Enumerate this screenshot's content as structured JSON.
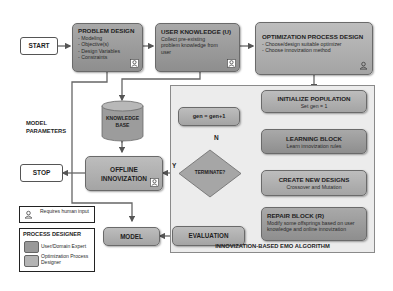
{
  "start": {
    "label": "START"
  },
  "stop": {
    "label": "STOP"
  },
  "problem_design": {
    "title": "PROBLEM DESIGN",
    "items": [
      "Modeling",
      "Objective(s)",
      "Design Variables",
      "Constraints"
    ]
  },
  "user_knowledge": {
    "title": "USER KNOWLEDGE (U)",
    "desc": "Collect pre-existing problem knowledge from user"
  },
  "optimization_process_design": {
    "title": "OPTIMIZATION PROCESS DESIGN",
    "items": [
      "Choose/design suitable optimizer",
      "Choose innovization method"
    ]
  },
  "model_parameters": {
    "line1": "MODEL",
    "line2": "PARAMETERS"
  },
  "knowledge_base": {
    "line1": "KNOWLEDGE",
    "line2": "BASE"
  },
  "offline_innovization": {
    "line1": "OFFLINE",
    "line2": "INNOVIZATION"
  },
  "model": {
    "label": "MODEL"
  },
  "evaluation": {
    "label": "EVALUATION"
  },
  "terminate": {
    "label": "TERMINATE?",
    "yes": "Y",
    "no": "N"
  },
  "gen_update": {
    "label": "gen = gen+1"
  },
  "emo_panel": {
    "title": "INNOVIZATION-BASED EMO ALGORITHM",
    "initialize": {
      "title": "INITIALIZE POPULATION",
      "desc": "Set gen = 1"
    },
    "learning": {
      "title": "LEARNING BLOCK",
      "desc": "Learn innovization rules"
    },
    "create": {
      "title": "CREATE NEW DESIGNS",
      "desc": "Crossover and Mutation"
    },
    "repair": {
      "title": "REPAIR BLOCK (R)",
      "desc": "Modify some offsprings based on user knowledge and online innovization"
    }
  },
  "legend": {
    "human_input": "Requires human input",
    "designer_title": "PROCESS DESIGNER",
    "user_expert": "User/Domain Expert",
    "optimization_designer": "Optimization Process Designer"
  },
  "colors": {
    "user_expert_fill": "#999999",
    "optimization_designer_fill": "#b0b0b0",
    "panel_fill": "#ececec",
    "arrow": "#555555"
  }
}
